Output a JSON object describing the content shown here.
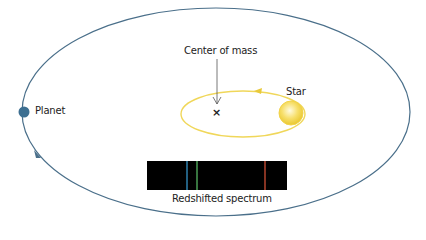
{
  "diagram": {
    "labels": {
      "center_of_mass": "Center of mass",
      "star": "Star",
      "planet": "Planet",
      "spectrum": "Redshifted spectrum"
    },
    "center_marker": "×",
    "colors": {
      "planet_orbit": "#4a6f8a",
      "planet": "#3d6f91",
      "star_orbit": "#f0d75a",
      "star": "#f5d84a",
      "spectrum_bg": "#000000",
      "line_blue": "#3aa0d8",
      "line_green": "#5cc46a",
      "line_red": "#e0553a"
    },
    "spectrum_lines": [
      "blue",
      "green",
      "red"
    ]
  }
}
